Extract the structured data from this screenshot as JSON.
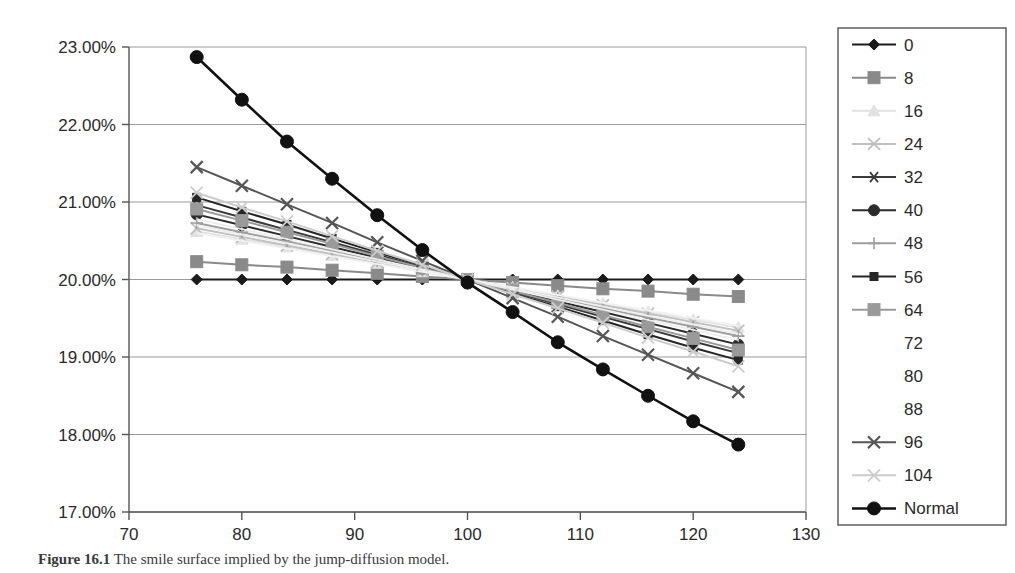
{
  "chart_data": {
    "type": "line",
    "title": "",
    "xlabel": "",
    "ylabel": "",
    "xlim": [
      70,
      130
    ],
    "ylim": [
      17.0,
      23.0
    ],
    "xticks": [
      70,
      80,
      90,
      100,
      110,
      120,
      130
    ],
    "yticks": [
      17.0,
      18.0,
      19.0,
      20.0,
      21.0,
      22.0,
      23.0
    ],
    "ytick_labels": [
      "17.00%",
      "18.00%",
      "19.00%",
      "20.00%",
      "21.00%",
      "22.00%",
      "23.00%"
    ],
    "xtick_labels": [
      "70",
      "80",
      "90",
      "100",
      "110",
      "120",
      "130"
    ],
    "grid": "horizontal",
    "legend_position": "right",
    "x": [
      76,
      80,
      84,
      88,
      92,
      96,
      100,
      104,
      108,
      112,
      116,
      120,
      124
    ],
    "series": [
      {
        "name": "0",
        "marker": "diamond",
        "color": "#1b1b1b",
        "values": [
          20.0,
          20.0,
          20.0,
          20.0,
          20.0,
          20.0,
          20.0,
          20.0,
          20.0,
          20.0,
          20.0,
          20.0,
          20.0
        ]
      },
      {
        "name": "8",
        "marker": "square",
        "color": "#8a8a8a",
        "values": [
          20.23,
          20.19,
          20.16,
          20.12,
          20.08,
          20.04,
          20.0,
          19.96,
          19.92,
          19.88,
          19.85,
          19.81,
          19.78
        ]
      },
      {
        "name": "16",
        "marker": "triangle",
        "color": "#e2e2e2",
        "values": [
          20.62,
          20.52,
          20.42,
          20.31,
          20.21,
          20.1,
          20.0,
          19.9,
          19.79,
          19.69,
          19.58,
          19.48,
          19.38
        ]
      },
      {
        "name": "24",
        "marker": "x",
        "color": "#c0c0c0",
        "values": [
          20.66,
          20.55,
          20.44,
          20.33,
          20.22,
          20.11,
          20.0,
          19.89,
          19.78,
          19.67,
          19.56,
          19.45,
          19.34
        ]
      },
      {
        "name": "32",
        "marker": "asterisk",
        "color": "#3a3a3a",
        "values": [
          20.96,
          20.8,
          20.64,
          20.48,
          20.32,
          20.16,
          20.0,
          19.84,
          19.68,
          19.52,
          19.36,
          19.2,
          19.05
        ]
      },
      {
        "name": "40",
        "marker": "circle",
        "color": "#2b2b2b",
        "values": [
          20.84,
          20.7,
          20.56,
          20.42,
          20.28,
          20.14,
          20.0,
          19.86,
          19.72,
          19.58,
          19.44,
          19.3,
          19.16
        ]
      },
      {
        "name": "48",
        "marker": "plus",
        "color": "#9e9e9e",
        "values": [
          20.73,
          20.61,
          20.49,
          20.37,
          20.24,
          20.12,
          20.0,
          19.88,
          19.76,
          19.63,
          19.51,
          19.39,
          19.27
        ]
      },
      {
        "name": "56",
        "marker": "small-square",
        "color": "#262626",
        "values": [
          21.06,
          20.88,
          20.71,
          20.53,
          20.35,
          20.18,
          20.0,
          19.82,
          19.65,
          19.47,
          19.29,
          19.12,
          18.96
        ]
      },
      {
        "name": "64",
        "marker": "square",
        "color": "#9a9a9a",
        "values": [
          20.91,
          20.76,
          20.61,
          20.46,
          20.3,
          20.15,
          20.0,
          19.85,
          19.7,
          19.54,
          19.39,
          19.24,
          19.09
        ]
      },
      {
        "name": "72",
        "marker": "none",
        "color": "#ededed",
        "values": [
          20.78,
          20.65,
          20.52,
          20.39,
          20.26,
          20.13,
          20.0,
          19.87,
          19.74,
          19.61,
          19.48,
          19.35,
          19.22
        ]
      },
      {
        "name": "80",
        "marker": "none",
        "color": "#efefef",
        "values": [
          20.7,
          20.58,
          20.47,
          20.35,
          20.23,
          20.12,
          20.0,
          19.88,
          19.77,
          19.65,
          19.53,
          19.42,
          19.3
        ]
      },
      {
        "name": "88",
        "marker": "none",
        "color": "#f1f1f1",
        "values": [
          20.6,
          20.5,
          20.4,
          20.3,
          20.2,
          20.1,
          20.0,
          19.9,
          19.8,
          19.7,
          19.6,
          19.5,
          19.4
        ]
      },
      {
        "name": "96",
        "marker": "x-bold",
        "color": "#555555",
        "values": [
          21.45,
          21.21,
          20.97,
          20.73,
          20.48,
          20.24,
          20.0,
          19.76,
          19.52,
          19.27,
          19.03,
          18.79,
          18.55
        ]
      },
      {
        "name": "104",
        "marker": "x",
        "color": "#cccccc",
        "values": [
          21.12,
          20.93,
          20.75,
          20.56,
          20.37,
          20.19,
          20.0,
          19.81,
          19.63,
          19.44,
          19.25,
          19.07,
          18.88
        ]
      },
      {
        "name": "Normal",
        "marker": "circle-large",
        "color": "#111111",
        "values": [
          22.87,
          22.32,
          21.78,
          21.3,
          20.83,
          20.38,
          19.96,
          19.58,
          19.19,
          18.84,
          18.5,
          18.17,
          17.87
        ]
      }
    ]
  },
  "legend": {
    "items": [
      {
        "label": "0"
      },
      {
        "label": "8"
      },
      {
        "label": "16"
      },
      {
        "label": "24"
      },
      {
        "label": "32"
      },
      {
        "label": "40"
      },
      {
        "label": "48"
      },
      {
        "label": "56"
      },
      {
        "label": "64"
      },
      {
        "label": "72"
      },
      {
        "label": "80"
      },
      {
        "label": "88"
      },
      {
        "label": "96"
      },
      {
        "label": "104"
      },
      {
        "label": "Normal"
      }
    ]
  },
  "caption": {
    "figure_number": "Figure 16.1",
    "text": "The smile surface implied by the jump-diffusion model."
  }
}
